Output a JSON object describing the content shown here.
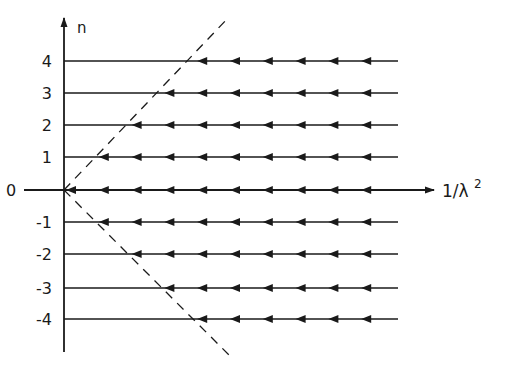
{
  "diagram": {
    "type": "flow-diagram",
    "y_axis": {
      "label": "n",
      "ticks": [
        "4",
        "3",
        "2",
        "1",
        "0",
        "-1",
        "-2",
        "-3",
        "-4"
      ]
    },
    "x_axis": {
      "label_main": "1/λ",
      "label_sup": "2"
    },
    "flow_lines": [
      {
        "n": 4,
        "label": "4",
        "arrows_start_step": 4
      },
      {
        "n": 3,
        "label": "3",
        "arrows_start_step": 3
      },
      {
        "n": 2,
        "label": "2",
        "arrows_start_step": 2
      },
      {
        "n": 1,
        "label": "1",
        "arrows_start_step": 1
      },
      {
        "n": 0,
        "label": "0",
        "arrows_start_step": 0
      },
      {
        "n": -1,
        "label": "-1",
        "arrows_start_step": 1
      },
      {
        "n": -2,
        "label": "-2",
        "arrows_start_step": 2
      },
      {
        "n": -3,
        "label": "-3",
        "arrows_start_step": 3
      },
      {
        "n": -4,
        "label": "-4",
        "arrows_start_step": 4
      }
    ],
    "arrow_direction": "left",
    "dashed_lines": [
      "upper-separatrix",
      "lower-separatrix"
    ],
    "colors": {
      "ink": "#1a1a1a",
      "background": "#ffffff"
    }
  }
}
